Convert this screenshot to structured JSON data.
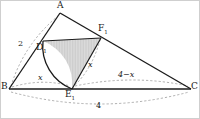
{
  "figure": {
    "type": "geometry-diagram",
    "colors": {
      "stroke": "#1a1a1a",
      "dashed_stroke": "#9a9a9a",
      "fill": "#d9d9d9",
      "hatch": "#bdbdbd",
      "background": "#ffffff",
      "border": "#cfcfcf"
    },
    "vertices": [
      {
        "id": "A",
        "label": "A",
        "sub": "",
        "x": 60,
        "y": 13,
        "lx": 57,
        "ly": 2
      },
      {
        "id": "B",
        "label": "B",
        "sub": "",
        "x": 9,
        "y": 89,
        "lx": 1,
        "ly": 83
      },
      {
        "id": "C",
        "label": "C",
        "sub": "",
        "x": 191,
        "y": 89,
        "lx": 192,
        "ly": 83
      },
      {
        "id": "D",
        "label": "D",
        "sub": "1",
        "x": 43,
        "y": 41,
        "lx": 38,
        "ly": 44
      },
      {
        "id": "E",
        "label": "E",
        "sub": "1",
        "x": 72,
        "y": 89,
        "lx": 66,
        "ly": 90
      },
      {
        "id": "F",
        "label": "F",
        "sub": "1",
        "x": 101,
        "y": 38,
        "lx": 99,
        "ly": 25
      }
    ],
    "measures": [
      {
        "id": "side-ab",
        "text": "2",
        "italic": false,
        "lx": 20,
        "ly": 41
      },
      {
        "id": "seg-be",
        "text": "x",
        "italic": true,
        "lx": 38,
        "ly": 75
      },
      {
        "id": "seg-ec",
        "text": "4−x",
        "italic": true,
        "lx": 120,
        "ly": 72
      },
      {
        "id": "seg-ef",
        "text": "x",
        "italic": true,
        "lx": 89,
        "ly": 62
      },
      {
        "id": "side-bc",
        "text": "4",
        "italic": false,
        "lx": 97,
        "ly": 103
      }
    ]
  }
}
